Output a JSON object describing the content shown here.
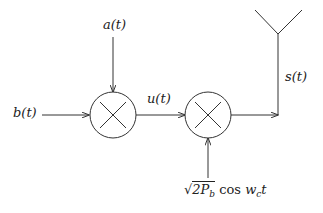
{
  "diagram": {
    "type": "block-diagram",
    "title": "",
    "colors": {
      "stroke": "#333333",
      "text": "#222222",
      "background": "#ffffff"
    },
    "signals": {
      "b": "b(t)",
      "a": "a(t)",
      "u": "u(t)",
      "s": "s(t)",
      "carrier": {
        "sqrt_symbol": "√",
        "radicand_main": "2P",
        "radicand_sub": "b",
        "func": "cos",
        "freq_main": "w",
        "freq_sub": "c",
        "var": "t"
      }
    },
    "blocks": [
      {
        "id": "multiplier-1",
        "symbol": "×",
        "inputs": [
          "b(t)",
          "a(t)"
        ],
        "output": "u(t)"
      },
      {
        "id": "multiplier-2",
        "symbol": "×",
        "inputs": [
          "u(t)",
          "√2P_b cos w_c t"
        ],
        "output": "s(t)"
      }
    ],
    "output_device": "antenna"
  }
}
